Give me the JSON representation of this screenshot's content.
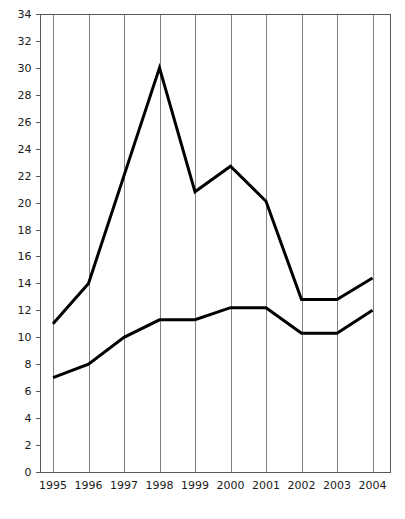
{
  "chart_data": {
    "type": "line",
    "title": "",
    "subtitle": "",
    "xlabel": "",
    "ylabel": "",
    "categories": [
      "1995",
      "1996",
      "1997",
      "1998",
      "1999",
      "2000",
      "2001",
      "2002",
      "2003",
      "2004"
    ],
    "x": [
      1995,
      1996,
      1997,
      1998,
      1999,
      2000,
      2001,
      2002,
      2003,
      2004
    ],
    "series": [
      {
        "name": "upper-series",
        "color": "#000000",
        "values": [
          11.0,
          14.0,
          22.0,
          30.0,
          20.8,
          22.7,
          20.1,
          12.8,
          12.8,
          14.4
        ]
      },
      {
        "name": "lower-series",
        "color": "#000000",
        "values": [
          7.0,
          8.0,
          10.0,
          11.3,
          11.3,
          12.2,
          12.2,
          10.3,
          10.3,
          12.0
        ]
      }
    ],
    "ylim": [
      0,
      34
    ],
    "ytick_step": 2,
    "yticks": [
      0,
      2,
      4,
      6,
      8,
      10,
      12,
      14,
      16,
      18,
      20,
      22,
      24,
      26,
      28,
      30,
      32,
      34
    ],
    "ytick_labels": [
      "0",
      "2",
      "4",
      "6",
      "8",
      "10",
      "12",
      "14",
      "16",
      "18",
      "20",
      "22",
      "24",
      "26",
      "28",
      "30",
      "32",
      "34"
    ],
    "grid": {
      "vertical": true,
      "horizontal": false,
      "color": "#808080"
    },
    "legend": {
      "visible": false,
      "position": "none",
      "entries": []
    },
    "annotations": [],
    "axis_color": "#5a5a5a",
    "background": "#ffffff"
  },
  "plot": {
    "left": 40,
    "right": 390,
    "top": 14,
    "bottom": 472,
    "first_gridline_x": 53,
    "gridline_spacing": 35.5
  }
}
